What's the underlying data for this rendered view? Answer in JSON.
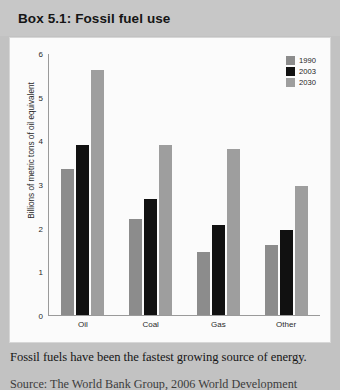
{
  "box": {
    "title": "Box 5.1: Fossil fuel use"
  },
  "caption": "Fossil fuels have been the fastest growing source of energy.",
  "source": "Source: The World Bank Group, 2006 World Development",
  "colors": {
    "series_1990": "#8c8c8c",
    "series_2003": "#111111",
    "series_2030": "#9e9e9e",
    "panel_background": "#fbfbfb",
    "page_background": "#c2c2c2",
    "axis": "#9a9a9a"
  },
  "chart_data": {
    "type": "bar",
    "title": "",
    "xlabel": "",
    "ylabel": "Billions of metric tons of oil equivalent",
    "categories": [
      "Oil",
      "Coal",
      "Gas",
      "Other"
    ],
    "yticks": [
      0,
      1,
      2,
      3,
      4,
      5,
      6
    ],
    "ylim": [
      0,
      6
    ],
    "grid": false,
    "legend_position": "top-right",
    "series": [
      {
        "name": "1990",
        "values": [
          3.35,
          2.2,
          1.45,
          1.6
        ]
      },
      {
        "name": "2003",
        "values": [
          3.9,
          2.65,
          2.05,
          1.95
        ]
      },
      {
        "name": "2030",
        "values": [
          5.6,
          3.9,
          3.8,
          2.95
        ]
      }
    ]
  }
}
